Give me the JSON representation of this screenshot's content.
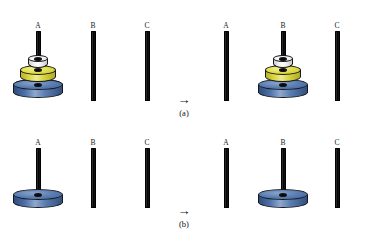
{
  "figure": {
    "background_color": "#ffffff",
    "arrow_glyph": "→"
  },
  "colors": {
    "rod": "#000000",
    "disk_blue": "#4b6fa8",
    "disk_yellow": "#dedb46",
    "disk_white": "#ffffff",
    "outline": "#17181c",
    "text": "#111111"
  },
  "pegs": {
    "labels": [
      "A",
      "B",
      "C"
    ]
  },
  "subfigures": [
    {
      "id": "a",
      "caption": "(a)",
      "arrow": "→",
      "panels": [
        {
          "side": "before",
          "stations": [
            {
              "label": "A",
              "disks": [
                "blue",
                "yellow",
                "white"
              ]
            },
            {
              "label": "B",
              "disks": []
            },
            {
              "label": "C",
              "disks": []
            }
          ]
        },
        {
          "side": "after",
          "stations": [
            {
              "label": "A",
              "disks": []
            },
            {
              "label": "B",
              "disks": [
                "blue",
                "yellow",
                "white"
              ]
            },
            {
              "label": "C",
              "disks": []
            }
          ]
        }
      ]
    },
    {
      "id": "b",
      "caption": "(b)",
      "arrow": "→",
      "panels": [
        {
          "side": "before",
          "stations": [
            {
              "label": "A",
              "disks": [
                "blue"
              ]
            },
            {
              "label": "B",
              "disks": []
            },
            {
              "label": "C",
              "disks": []
            }
          ]
        },
        {
          "side": "after",
          "stations": [
            {
              "label": "A",
              "disks": []
            },
            {
              "label": "B",
              "disks": [
                "blue"
              ]
            },
            {
              "label": "C",
              "disks": []
            }
          ]
        }
      ]
    }
  ]
}
